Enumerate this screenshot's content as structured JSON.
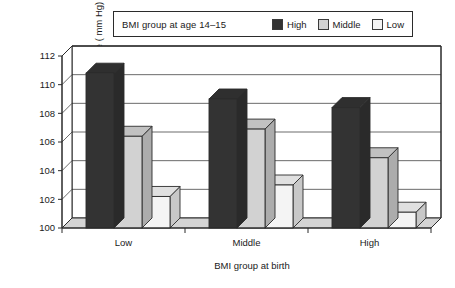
{
  "chart_data": {
    "type": "bar",
    "title": "",
    "subtitle": "",
    "xlabel": "BMI group at birth",
    "ylabel": "Systolic blood pressure ( mm Hg)",
    "categories": [
      "Low",
      "Middle",
      "High"
    ],
    "ylim": [
      100,
      112
    ],
    "yticks": [
      100,
      102,
      104,
      106,
      108,
      110,
      112
    ],
    "ytick_labels": [
      "100",
      "102",
      "104",
      "106",
      "108",
      "110",
      "112"
    ],
    "grid": true,
    "legend_position": "top",
    "legend_title": "BMI group at age 14–15",
    "series": [
      {
        "name": "High",
        "color": "#333333",
        "values": [
          110.8,
          109.0,
          108.4
        ]
      },
      {
        "name": "Middle",
        "color": "#d2d2d2",
        "values": [
          106.4,
          106.9,
          104.9
        ]
      },
      {
        "name": "Low",
        "color": "#f4f4f4",
        "values": [
          102.2,
          103.0,
          101.1
        ]
      }
    ],
    "annotations": [],
    "style": "3d-grouped-bars"
  },
  "legend": {
    "title": "BMI group at age 14–15",
    "entries": [
      {
        "label": "High",
        "swatch": "#333333"
      },
      {
        "label": "Middle",
        "swatch": "#d2d2d2"
      },
      {
        "label": "Low",
        "swatch": "#f4f4f4"
      }
    ]
  },
  "axes": {
    "y_title": "Systolic blood pressure ( mm Hg)",
    "x_title": "BMI group at birth",
    "y_ticks": [
      "100",
      "102",
      "104",
      "106",
      "108",
      "110",
      "112"
    ],
    "x_ticks": [
      "Low",
      "Middle",
      "High"
    ]
  },
  "colors": {
    "series_high": "#333333",
    "series_middle": "#d2d2d2",
    "series_low": "#f4f4f4",
    "axis": "#2b2b2b",
    "floor": "#d4d4d4",
    "background": "#ffffff"
  }
}
